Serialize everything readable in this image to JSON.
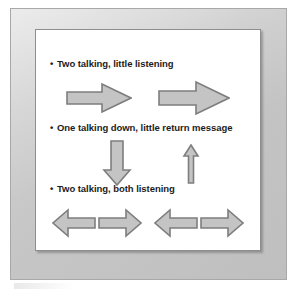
{
  "figure": {
    "background_color": "#ffffff",
    "mat_color": "#c9c9c9",
    "panel_color": "#ffffff",
    "arrow_fill": "#c4c4c4",
    "arrow_stroke": "#7e7e7e",
    "text_color": "#1c1c1c"
  },
  "bullets": [
    {
      "marker": "•",
      "text": "Two talking, little listening"
    },
    {
      "marker": "•",
      "text": "One talking down, little return message"
    },
    {
      "marker": "•",
      "text": "Two talking, both listening"
    }
  ],
  "arrow_groups": [
    {
      "name": "two-talking-little-listening",
      "arrows": [
        {
          "direction": "right",
          "size": "large"
        },
        {
          "direction": "right",
          "size": "large"
        }
      ]
    },
    {
      "name": "one-talking-down-little-return",
      "arrows": [
        {
          "direction": "down",
          "size": "large"
        },
        {
          "direction": "up",
          "size": "small"
        }
      ]
    },
    {
      "name": "two-talking-both-listening",
      "arrows": [
        {
          "direction": "left",
          "size": "medium"
        },
        {
          "direction": "right",
          "size": "medium"
        },
        {
          "direction": "left",
          "size": "medium"
        },
        {
          "direction": "right",
          "size": "medium"
        }
      ]
    }
  ]
}
